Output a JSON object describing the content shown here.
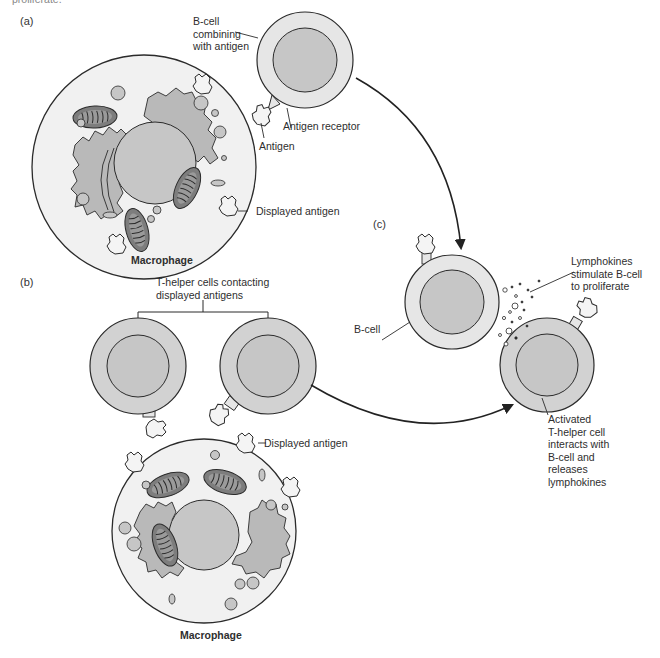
{
  "caption_cutoff": "proliferate.",
  "panels": {
    "a": {
      "label": "(a)",
      "bcell_label": "B-cell\ncombining\nwith antigen",
      "antigen_receptor_label": "Antigen receptor",
      "antigen_label": "Antigen",
      "displayed_antigen_label": "Displayed antigen",
      "macrophage_label": "Macrophage"
    },
    "b": {
      "label": "(b)",
      "thelper_label": "T-helper cells contacting\ndisplayed antigens",
      "displayed_antigen_label": "Displayed antigen",
      "macrophage_label": "Macrophage"
    },
    "c": {
      "label": "(c)",
      "bcell_label": "B-cell",
      "lymphokines_label": "Lymphokines\nstimulate B-cell\nto proliferate",
      "activated_label": "Activated\nT-helper cell\ninteracts with\nB-cell and\nreleases\nlymphokines"
    }
  },
  "colors": {
    "outline": "#2b2b2b",
    "cell_light": "#e6e6e6",
    "cell_mid": "#d2d2d2",
    "nucleus": "#c6c6c6",
    "cytoplasm": "#f1f1f1",
    "mito": "#7d7d7d",
    "er": "#b9b9b9"
  }
}
